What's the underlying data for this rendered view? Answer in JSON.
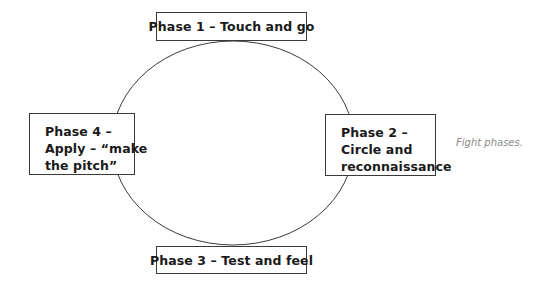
{
  "diagram": {
    "type": "cycle",
    "caption": "Fight phases.",
    "phases": [
      {
        "id": 1,
        "label": "Phase 1 – Touch and go",
        "lines": [
          "Phase 1 – Touch and go"
        ],
        "position": "top"
      },
      {
        "id": 2,
        "label": "Phase 2 – Circle and reconnaissance",
        "lines": [
          "Phase 2 –",
          "Circle and",
          "reconnaissance"
        ],
        "position": "right"
      },
      {
        "id": 3,
        "label": "Phase 3 – Test and feel",
        "lines": [
          "Phase 3 – Test and feel"
        ],
        "position": "bottom"
      },
      {
        "id": 4,
        "label": "Phase 4 – Apply – “make the pitch”",
        "lines": [
          "Phase 4 –",
          "Apply – “make",
          "the pitch”"
        ],
        "position": "left"
      }
    ],
    "colors": {
      "stroke": "#3a3a3a",
      "text": "#1a1a1a",
      "caption": "#8a8a8a",
      "background": "#ffffff"
    }
  }
}
